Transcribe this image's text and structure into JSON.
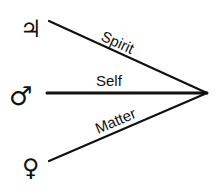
{
  "diagram": {
    "convergence_point": [
      207,
      93
    ],
    "colors": {
      "line": "#111111",
      "background": "#ffffff"
    },
    "branches": [
      {
        "id": "spirit",
        "label": "Spirit",
        "symbol": "♃",
        "symbol_name": "jupiter-icon",
        "start": [
          49,
          21
        ]
      },
      {
        "id": "self",
        "label": "Self",
        "symbol": "♂",
        "symbol_name": "mars-icon",
        "start": [
          47,
          93
        ]
      },
      {
        "id": "matter",
        "label": "Matter",
        "symbol": "♀",
        "symbol_name": "venus-icon",
        "start": [
          49,
          161
        ]
      }
    ]
  }
}
